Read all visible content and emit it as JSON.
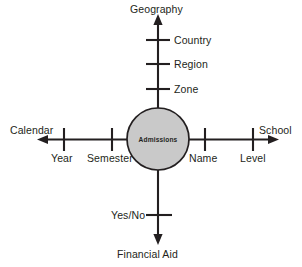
{
  "diagram": {
    "type": "star-schema",
    "background_color": "#ffffff",
    "line_color": "#231f20",
    "hub": {
      "label": "Admissions",
      "fill_color": "#c9c9c9",
      "stroke_color": "#231f20",
      "center_x": 158,
      "center_y": 139,
      "radius": 31
    },
    "axes": [
      {
        "name": "north",
        "title": "Geography",
        "direction": "up",
        "ticks": [
          {
            "label": "Country",
            "position": 40
          },
          {
            "label": "Region",
            "position": 64
          },
          {
            "label": "Zone",
            "position": 89
          }
        ]
      },
      {
        "name": "west",
        "title": "Calendar",
        "direction": "left",
        "ticks": [
          {
            "label": "Year",
            "position": 64
          },
          {
            "label": "Semester",
            "position": 112
          }
        ]
      },
      {
        "name": "east",
        "title": "School",
        "direction": "right",
        "ticks": [
          {
            "label": "Name",
            "position": 205
          },
          {
            "label": "Level",
            "position": 253
          }
        ]
      },
      {
        "name": "south",
        "title": "Financial Aid",
        "direction": "down",
        "ticks": [
          {
            "label": "Yes/No",
            "position": 215
          }
        ]
      }
    ]
  }
}
